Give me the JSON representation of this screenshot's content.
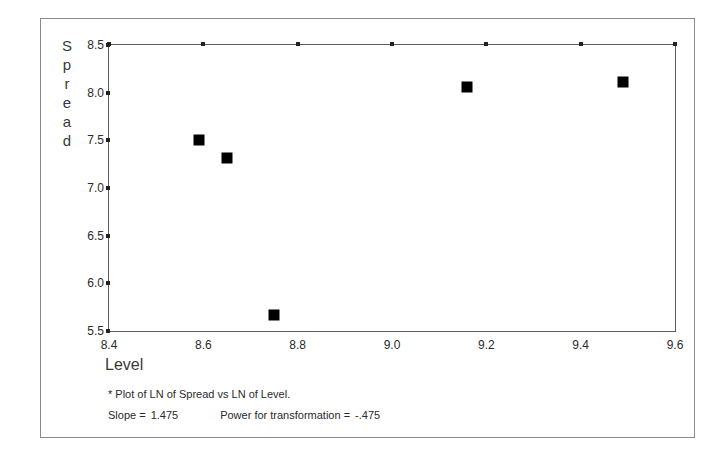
{
  "chart_data": {
    "type": "scatter",
    "title": "",
    "subtitle": "",
    "xlabel": "Level",
    "ylabel": "Spread",
    "ylabel_letters": [
      "S",
      "p",
      "r",
      "e",
      "a",
      "d"
    ],
    "xlim": [
      8.4,
      9.6
    ],
    "ylim": [
      5.5,
      8.5
    ],
    "xticks": [
      "8.4",
      "8.6",
      "8.8",
      "9.0",
      "9.2",
      "9.4",
      "9.6"
    ],
    "xtick_values": [
      8.4,
      8.6,
      8.8,
      9.0,
      9.2,
      9.4,
      9.6
    ],
    "yticks": [
      "5.5",
      "6.0",
      "6.5",
      "7.0",
      "7.5",
      "8.0",
      "8.5"
    ],
    "ytick_values": [
      5.5,
      6.0,
      6.5,
      7.0,
      7.5,
      8.0,
      8.5
    ],
    "grid": false,
    "legend": false,
    "marker": "filled-square",
    "marker_color": "#000000",
    "points": [
      {
        "x": 8.59,
        "y": 7.5
      },
      {
        "x": 8.65,
        "y": 7.31
      },
      {
        "x": 8.75,
        "y": 5.67
      },
      {
        "x": 9.16,
        "y": 8.06
      },
      {
        "x": 9.49,
        "y": 8.11
      }
    ]
  },
  "footnotes": {
    "note": "* Plot of LN of Spread vs LN of Level.",
    "slope_label": "Slope =",
    "slope_value": "1.475",
    "power_label": "Power for transformation =",
    "power_value": "-.475"
  },
  "colors": {
    "frame": "#8a8a8a",
    "axis": "#5c5c5c",
    "marker": "#000000",
    "text": "#2b2b2b",
    "background": "#ffffff"
  }
}
